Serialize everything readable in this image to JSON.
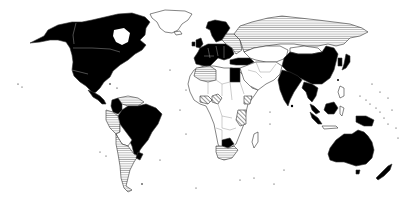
{
  "map": {
    "type": "world-choropleth",
    "projection": "equirectangular-like (Robinson style)",
    "legend_visible": false,
    "title": "",
    "categories": [
      {
        "key": "black",
        "fill": "#000000",
        "pattern": "solid"
      },
      {
        "key": "hz",
        "fill": "#000000",
        "pattern": "horizontal-lines"
      },
      {
        "key": "dg",
        "fill": "#000000",
        "pattern": "diagonal-lines"
      },
      {
        "key": "white",
        "fill": "#ffffff",
        "pattern": "none"
      }
    ],
    "regions": {
      "black": [
        "United States",
        "Canada",
        "Mexico",
        "Central America (part)",
        "Colombia",
        "Brazil",
        "Western Europe",
        "Scandinavia",
        "Turkey",
        "Egypt",
        "Botswana",
        "China",
        "India",
        "Japan",
        "Southeast Asia (part)",
        "Malaysia",
        "Indonesia (part)",
        "Australia",
        "New Zealand"
      ],
      "hz": [
        "Russia",
        "Kazakhstan",
        "Mongolia (part)",
        "Algeria",
        "Venezuela",
        "Peru",
        "Bolivia",
        "Argentina",
        "Chile",
        "South Africa",
        "Eastern Europe (part)"
      ],
      "dg": [
        "Ivory Coast/Ghana region",
        "Kenya/Tanzania region",
        "Ethiopia (part)"
      ],
      "white": [
        "Greenland",
        "Middle East",
        "Most of Africa",
        "Central Asia",
        "Paraguay",
        "Madagascar"
      ]
    }
  }
}
